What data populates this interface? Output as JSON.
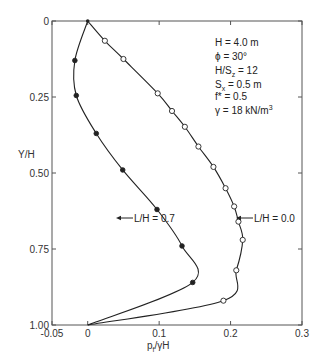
{
  "chart_data": {
    "type": "line",
    "title": "",
    "xlabel": "p_f/γH",
    "ylabel": "Y/H",
    "xlim": [
      -0.05,
      0.3
    ],
    "ylim": [
      1.0,
      0.0
    ],
    "y_inverted": true,
    "grid": false,
    "x_ticks": [
      -0.05,
      0,
      0.1,
      0.2,
      0.3
    ],
    "x_tick_labels": [
      "-0.05",
      "0",
      "0.1",
      "0.2",
      "0.3"
    ],
    "y_ticks": [
      0,
      0.25,
      0.5,
      0.75,
      1.0
    ],
    "y_tick_labels": [
      "0",
      "0.25",
      "0.50",
      "0.75",
      "1.00"
    ],
    "legend_position": "inline-annotations",
    "parameters": [
      "H = 4.0 m",
      "ϕ = 30°",
      "H/Sz = 12",
      "Sx = 0.5 m",
      "f* = 0.5",
      "γ = 18 kN/m³"
    ],
    "series": [
      {
        "name": "L/H = 0.0",
        "marker": "open-circle",
        "x": [
          0,
          0.024,
          0.05,
          0.098,
          0.118,
          0.136,
          0.155,
          0.176,
          0.193,
          0.205,
          0.211,
          0.217,
          0.208,
          0.19,
          0
        ],
        "y": [
          0,
          0.065,
          0.125,
          0.238,
          0.296,
          0.348,
          0.413,
          0.48,
          0.55,
          0.61,
          0.66,
          0.72,
          0.82,
          0.92,
          1.0
        ]
      },
      {
        "name": "L/H = 0.7",
        "marker": "filled-circle",
        "x": [
          0,
          -0.018,
          -0.016,
          0.012,
          0.049,
          0.097,
          0.132,
          0.147,
          0
        ],
        "y": [
          0,
          0.13,
          0.245,
          0.37,
          0.49,
          0.62,
          0.74,
          0.86,
          1.0
        ]
      }
    ],
    "annotations": [
      {
        "text": "L/H = 0.7",
        "arrow_to": [
          0.104,
          0.64
        ]
      },
      {
        "text": "L/H = 0.0",
        "arrow_to": [
          0.209,
          0.64
        ]
      }
    ]
  },
  "labels": {
    "ylabel": "Y/H",
    "xlabel_main": "p",
    "xlabel_sub": "f",
    "xlabel_rest": "/γH",
    "xticks": [
      "-0.05",
      "0",
      "0.1",
      "0.2",
      "0.3"
    ],
    "yticks": [
      "0",
      "0.25",
      "0.50",
      "0.75",
      "1.00"
    ],
    "annot_07": "L/H = 0.7",
    "annot_00": "L/H = 0.0",
    "param_H": "H = 4.0 m",
    "param_phi": "ϕ = 30°",
    "param_HSz_a": "H/S",
    "param_HSz_sub": "z",
    "param_HSz_b": " = 12",
    "param_Sx_a": "S",
    "param_Sx_sub": "x",
    "param_Sx_b": " = 0.5 m",
    "param_f": "f* = 0.5",
    "param_gamma_a": "γ = 18 kN/m",
    "param_gamma_sup": "3"
  }
}
